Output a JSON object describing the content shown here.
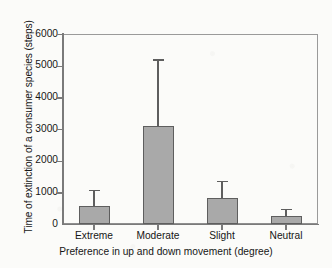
{
  "chart_data": {
    "type": "bar",
    "title": "",
    "xlabel": "Preference in up and down movement (degree)",
    "ylabel": "Time of extinction of a consumer species (steps)",
    "categories": [
      "Extreme",
      "Moderate",
      "Slight",
      "Neutral"
    ],
    "values": [
      570,
      3110,
      820,
      260
    ],
    "error_upper": [
      1080,
      5200,
      1360,
      480
    ],
    "errors": [
      510,
      2090,
      540,
      220
    ],
    "ylim": [
      0,
      6000
    ],
    "yticks": [
      0,
      1000,
      2000,
      3000,
      4000,
      5000,
      6000
    ],
    "ytick_labels": [
      "0",
      "1000",
      "2000",
      "3000",
      "4000",
      "5000",
      "6000"
    ],
    "grid": false,
    "legend": null,
    "legend_position": "none",
    "bar_color": "#a9a9a9",
    "bar_edge_color": "#5e5e5e",
    "error_bar_color": "#5e5e5e",
    "axis_color": "#7a7a7a",
    "error_bar_style": "upper-only"
  },
  "axes": {
    "y_title": "Time of extinction of a consumer species (steps)",
    "x_title": "Preference in up and down movement (degree)"
  },
  "ticks": {
    "y": [
      "6000",
      "5000",
      "4000",
      "3000",
      "2000",
      "1000",
      "0"
    ],
    "x": [
      "Extreme",
      "Moderate",
      "Slight",
      "Neutral"
    ]
  }
}
